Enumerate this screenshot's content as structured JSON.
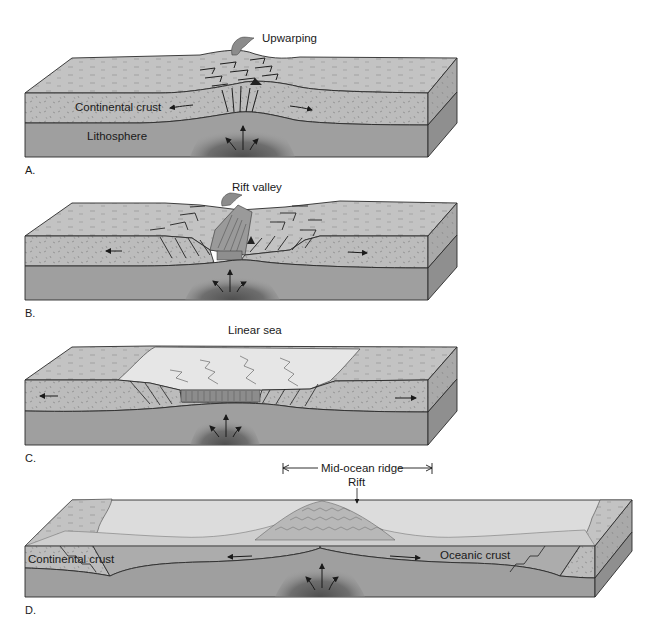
{
  "figure": {
    "type": "block-diagram-series",
    "colors": {
      "crust": "#b9b9b9",
      "crust_top": "#c4c4c4",
      "lithosphere": "#9d9d9d",
      "plume": "#5e5e5e",
      "sea": "#e4e4e4",
      "ocean_crust": "#a8a8a8",
      "outline": "#2b2b2b"
    }
  },
  "panels": [
    {
      "id": "A",
      "letter": "A.",
      "title": "Upwarping",
      "labels": {
        "crust": "Continental crust",
        "mantle": "Lithosphere"
      }
    },
    {
      "id": "B",
      "letter": "B.",
      "title": "Rift valley"
    },
    {
      "id": "C",
      "letter": "C.",
      "title": "Linear sea"
    },
    {
      "id": "D",
      "letter": "D.",
      "bracket_label": "Mid-ocean ridge",
      "rift_label": "Rift",
      "labels": {
        "continental": "Continental crust",
        "oceanic": "Oceanic crust"
      }
    }
  ]
}
